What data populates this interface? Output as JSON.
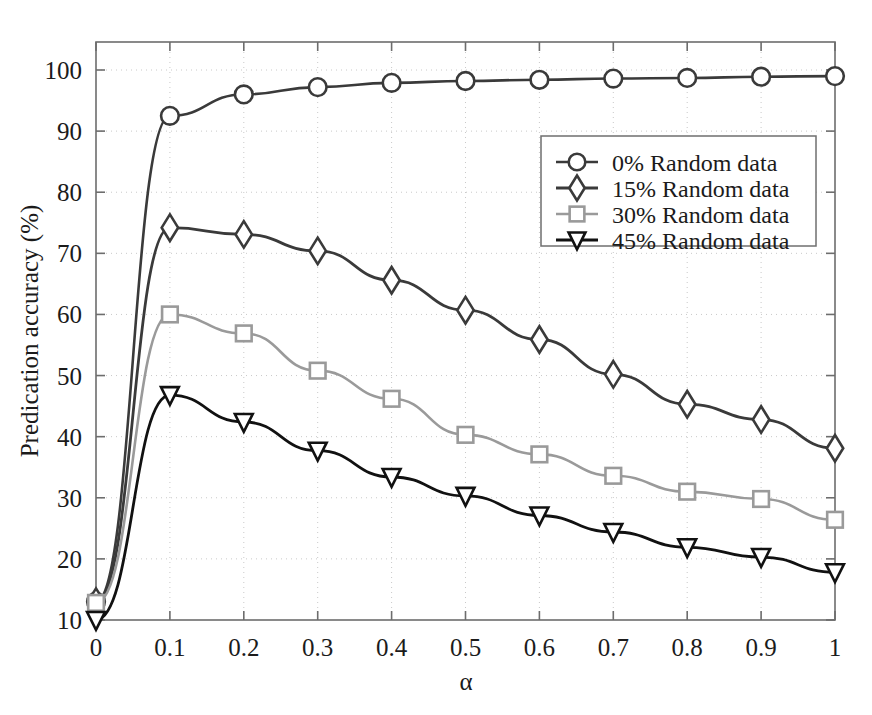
{
  "figure": {
    "background_color": "#ffffff",
    "cut_off_caption_top": ""
  },
  "chart_data": {
    "type": "line",
    "title": "",
    "xlabel": "α",
    "ylabel": "Predication accuracy (%)",
    "x": [
      0,
      0.1,
      0.2,
      0.3,
      0.4,
      0.5,
      0.6,
      0.7,
      0.8,
      0.9,
      1
    ],
    "xlim": [
      0,
      1
    ],
    "ylim": [
      7,
      103
    ],
    "xticks": [
      "0",
      "0.1",
      "0.2",
      "0.3",
      "0.4",
      "0.5",
      "0.6",
      "0.7",
      "0.8",
      "0.9",
      "1"
    ],
    "xtick_values": [
      0,
      0.1,
      0.2,
      0.3,
      0.4,
      0.5,
      0.6,
      0.7,
      0.8,
      0.9,
      1
    ],
    "yticks": [
      "10",
      "20",
      "30",
      "40",
      "50",
      "60",
      "70",
      "80",
      "90",
      "100"
    ],
    "ytick_values": [
      10,
      20,
      30,
      40,
      50,
      60,
      70,
      80,
      90,
      100
    ],
    "grid": true,
    "legend_position": "upper right",
    "series": [
      {
        "name": "0% Random data",
        "marker": "circle",
        "color": "#3a3a3a",
        "line_width": 2.6,
        "values": [
          13,
          92.5,
          96,
          97.2,
          97.9,
          98.2,
          98.4,
          98.6,
          98.7,
          98.9,
          99
        ]
      },
      {
        "name": "15% Random data",
        "marker": "diamond",
        "color": "#3a3a3a",
        "line_width": 2.8,
        "values": [
          13,
          74.2,
          73.1,
          70.4,
          65.6,
          60.7,
          55.9,
          50.2,
          45.3,
          42.8,
          38.1
        ]
      },
      {
        "name": "30% Random data",
        "marker": "square",
        "color": "#9a9a9a",
        "line_width": 2.6,
        "values": [
          12.8,
          60,
          56.9,
          50.8,
          46.2,
          40.3,
          37.1,
          33.6,
          31,
          29.8,
          26.4
        ]
      },
      {
        "name": "45% Random data",
        "marker": "triangle-down",
        "color": "#111111",
        "line_width": 2.8,
        "values": [
          10,
          46.8,
          42.4,
          37.7,
          33.4,
          30.3,
          27.1,
          24.4,
          21.9,
          20.3,
          17.8
        ]
      }
    ]
  }
}
